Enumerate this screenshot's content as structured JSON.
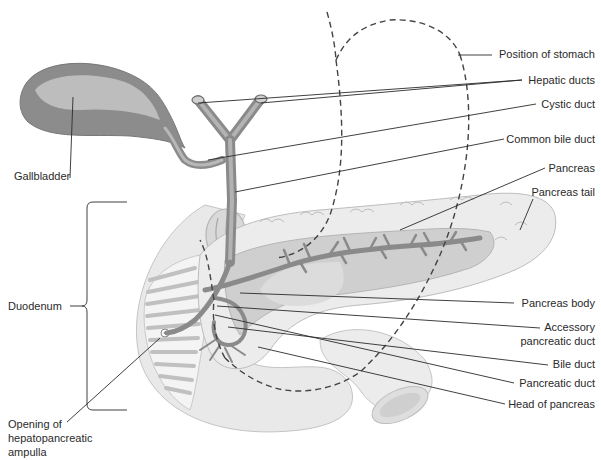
{
  "diagram": {
    "colors": {
      "background": "#ffffff",
      "organ_light": "#e9e9e9",
      "organ_mid": "#cfcfcf",
      "organ_dark": "#9a9a9a",
      "gallbladder_outer": "#8c8c8c",
      "gallbladder_inner": "#bdbdbd",
      "duct": "#8a8a8a",
      "label_text": "#2a2a2a",
      "leader_line": "#2a2a2a"
    },
    "labels": {
      "position_of_stomach": "Position of stomach",
      "hepatic_ducts": "Hepatic ducts",
      "cystic_duct": "Cystic duct",
      "common_bile_duct": "Common bile duct",
      "pancreas": "Pancreas",
      "pancreas_tail": "Pancreas tail",
      "gallbladder": "Gallbladder",
      "duodenum": "Duodenum",
      "pancreas_body": "Pancreas body",
      "accessory_pancreatic_duct_line1": "Accessory",
      "accessory_pancreatic_duct_line2": "pancreatic duct",
      "bile_duct": "Bile duct",
      "pancreatic_duct": "Pancreatic duct",
      "head_of_pancreas": "Head of pancreas",
      "opening_line1": "Opening of",
      "opening_line2": "hepatopancreatic",
      "opening_line3": "ampulla"
    }
  }
}
